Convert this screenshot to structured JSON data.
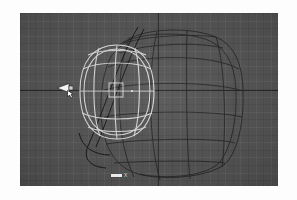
{
  "app": {
    "kind": "3d-modeling-viewport",
    "view_label": "X",
    "background_color": "#565656",
    "grid_color": "#6b6b6b",
    "axis_color": "#2d2d2d",
    "selected_color": "#e6e6e6",
    "wireframe_color": "#262626",
    "frame_color": "#ffffff"
  },
  "viewport": {
    "width": 258,
    "height": 173,
    "grid": {
      "enabled": true,
      "fine_spacing_px": 7.6,
      "coarse_spacing_px": 15.2
    },
    "axes": {
      "horizontal_y": 77,
      "vertical_x": 138
    }
  },
  "gizmo": {
    "label": "X",
    "name": "axis-gizmo"
  },
  "objects": [
    {
      "name": "outer-hull-mesh",
      "state": "unselected",
      "color": "#262626",
      "description": "large rounded-box wireframe body"
    },
    {
      "name": "inner-oval-mesh",
      "state": "selected",
      "color": "#e6e6e6",
      "description": "smaller ovoid wireframe with latitude and longitude segments"
    },
    {
      "name": "profile-curve",
      "state": "unselected",
      "color": "#1a1a1a",
      "description": "thin vertical profile curve through the center"
    }
  ],
  "cursor": {
    "name": "mouse-cursor",
    "shape": "left-arrow",
    "x": 36,
    "y": 68
  }
}
